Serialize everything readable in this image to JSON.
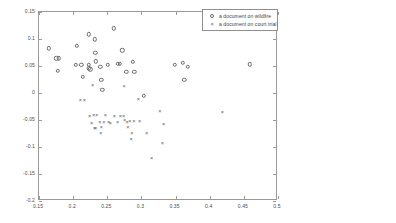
{
  "chart_data": {
    "type": "scatter",
    "title": "",
    "xlabel": "",
    "ylabel": "",
    "xlim": [
      0.15,
      0.5
    ],
    "ylim": [
      -0.2,
      0.15
    ],
    "xticks": [
      0.15,
      0.2,
      0.25,
      0.3,
      0.35,
      0.4,
      0.45,
      0.5
    ],
    "xticklabels": [
      "0.15",
      "0.2",
      "0.25",
      "0.3",
      "0.35",
      "0.4",
      "0.45",
      "0.5"
    ],
    "yticks": [
      -0.2,
      -0.15,
      -0.1,
      -0.05,
      0,
      0.05,
      0.1,
      0.15
    ],
    "yticklabels": [
      "-0.2",
      "-0.15",
      "-0.1",
      "-0.05",
      "0",
      "0.05",
      "0.1",
      "0.15"
    ],
    "grid": false,
    "legend_position": "upper right",
    "series": [
      {
        "name": "a document on wildfire",
        "marker": "circle",
        "color": "#6b6b6b",
        "points": [
          [
            0.1645,
            0.0825
          ],
          [
            0.1755,
            0.0645
          ],
          [
            0.179,
            0.064
          ],
          [
            0.1775,
            0.041
          ],
          [
            0.2055,
            0.0875
          ],
          [
            0.2035,
            0.0525
          ],
          [
            0.212,
            0.052
          ],
          [
            0.2145,
            0.0295
          ],
          [
            0.223,
            0.1085
          ],
          [
            0.2225,
            0.052
          ],
          [
            0.2225,
            0.0455
          ],
          [
            0.225,
            0.044
          ],
          [
            0.232,
            0.0995
          ],
          [
            0.2325,
            0.0745
          ],
          [
            0.233,
            0.059
          ],
          [
            0.2395,
            0.049
          ],
          [
            0.2415,
            0.024
          ],
          [
            0.2425,
            0.0055
          ],
          [
            0.251,
            0.0525
          ],
          [
            0.2595,
            0.1195
          ],
          [
            0.2655,
            0.0545
          ],
          [
            0.268,
            0.0545
          ],
          [
            0.272,
            0.079
          ],
          [
            0.278,
            0.0395
          ],
          [
            0.2875,
            0.058
          ],
          [
            0.2895,
            0.039
          ],
          [
            0.3035,
            -0.0055
          ],
          [
            0.349,
            0.052
          ],
          [
            0.3605,
            0.0555
          ],
          [
            0.363,
            0.024
          ],
          [
            0.3675,
            0.049
          ],
          [
            0.4585,
            0.0535
          ]
        ]
      },
      {
        "name": "a document on court trial",
        "marker": "x",
        "color": "#5c5c5c",
        "points": [
          [
            0.2105,
            -0.0135
          ],
          [
            0.2165,
            -0.0125
          ],
          [
            0.2285,
            0.015
          ],
          [
            0.224,
            -0.0425
          ],
          [
            0.227,
            -0.0555
          ],
          [
            0.23,
            -0.04
          ],
          [
            0.231,
            -0.064
          ],
          [
            0.233,
            -0.0655
          ],
          [
            0.2345,
            -0.041
          ],
          [
            0.239,
            -0.0545
          ],
          [
            0.2405,
            -0.0745
          ],
          [
            0.2415,
            -0.063
          ],
          [
            0.245,
            -0.054
          ],
          [
            0.247,
            -0.0405
          ],
          [
            0.252,
            -0.0535
          ],
          [
            0.2545,
            -0.0555
          ],
          [
            0.2605,
            -0.043
          ],
          [
            0.265,
            -0.0545
          ],
          [
            0.269,
            -0.042
          ],
          [
            0.2745,
            0.0125
          ],
          [
            0.274,
            -0.0425
          ],
          [
            0.2755,
            -0.05
          ],
          [
            0.279,
            -0.0545
          ],
          [
            0.28,
            -0.063
          ],
          [
            0.283,
            -0.0525
          ],
          [
            0.285,
            -0.0855
          ],
          [
            0.286,
            -0.074
          ],
          [
            0.289,
            -0.052
          ],
          [
            0.2955,
            -0.0105
          ],
          [
            0.2975,
            -0.052
          ],
          [
            0.3075,
            -0.0735
          ],
          [
            0.315,
            -0.1195
          ],
          [
            0.327,
            -0.0325
          ],
          [
            0.3305,
            -0.092
          ],
          [
            0.3325,
            -0.0575
          ],
          [
            0.4185,
            -0.0345
          ]
        ]
      }
    ]
  },
  "legend": {
    "entries": [
      {
        "label": "a document on wildfire"
      },
      {
        "label": "a document on court trial"
      }
    ]
  }
}
